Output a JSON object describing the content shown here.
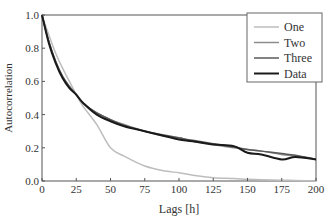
{
  "chart_data": {
    "type": "line",
    "title": "",
    "xlabel": "Lags [h]",
    "ylabel": "Autocorrelation",
    "xlim": [
      0,
      200
    ],
    "ylim": [
      0.0,
      1.0
    ],
    "xticks": [
      0,
      25,
      50,
      75,
      100,
      125,
      150,
      175,
      200
    ],
    "xtick_labels": [
      "0",
      "25",
      "50",
      "75",
      "100",
      "125",
      "150",
      "175",
      "200"
    ],
    "yticks": [
      0.0,
      0.2,
      0.4,
      0.6,
      0.8,
      1.0
    ],
    "ytick_labels": [
      "0.0",
      "0.2",
      "0.4",
      "0.6",
      "0.8",
      "1.0"
    ],
    "grid": false,
    "legend_position": "upper right",
    "x": [
      0,
      5,
      10,
      15,
      20,
      25,
      30,
      40,
      50,
      60,
      75,
      90,
      100,
      110,
      125,
      140,
      150,
      160,
      175,
      185,
      200
    ],
    "series": [
      {
        "name": "One",
        "color": "#bdbdbd",
        "values": [
          1.0,
          0.88,
          0.77,
          0.68,
          0.6,
          0.52,
          0.45,
          0.34,
          0.2,
          0.15,
          0.09,
          0.06,
          0.05,
          0.035,
          0.02,
          0.015,
          0.01,
          0.008,
          0.005,
          0.003,
          0.0
        ]
      },
      {
        "name": "Two",
        "color": "#8c8c8c",
        "values": [
          1.0,
          0.84,
          0.72,
          0.63,
          0.57,
          0.52,
          0.47,
          0.41,
          0.37,
          0.34,
          0.3,
          0.27,
          0.26,
          0.24,
          0.22,
          0.2,
          0.19,
          0.18,
          0.16,
          0.15,
          0.13
        ]
      },
      {
        "name": "Three",
        "color": "#5a5a5a",
        "values": [
          1.0,
          0.84,
          0.72,
          0.63,
          0.57,
          0.52,
          0.47,
          0.41,
          0.37,
          0.335,
          0.3,
          0.275,
          0.26,
          0.245,
          0.225,
          0.205,
          0.19,
          0.18,
          0.165,
          0.155,
          0.13
        ]
      },
      {
        "name": "Data",
        "color": "#1a1a1a",
        "values": [
          1.0,
          0.83,
          0.71,
          0.62,
          0.56,
          0.52,
          0.47,
          0.4,
          0.36,
          0.33,
          0.3,
          0.27,
          0.25,
          0.24,
          0.22,
          0.21,
          0.17,
          0.16,
          0.13,
          0.145,
          0.13
        ]
      }
    ]
  },
  "legend": {
    "items": [
      {
        "label": "One",
        "color": "#bdbdbd"
      },
      {
        "label": "Two",
        "color": "#8c8c8c"
      },
      {
        "label": "Three",
        "color": "#5a5a5a"
      },
      {
        "label": "Data",
        "color": "#1a1a1a"
      }
    ]
  }
}
